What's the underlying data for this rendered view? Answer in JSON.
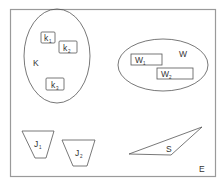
{
  "diagram": {
    "universe_label": "E",
    "sets": [
      {
        "id": "K",
        "label": "K",
        "shape": "ellipse",
        "members": [
          {
            "base": "k",
            "sub": "1"
          },
          {
            "base": "k",
            "sub": "2"
          },
          {
            "base": "k",
            "sub": "3"
          }
        ]
      },
      {
        "id": "W",
        "label": "W",
        "shape": "ellipse",
        "members": [
          {
            "base": "W",
            "sub": "1"
          },
          {
            "base": "W",
            "sub": "2"
          }
        ]
      }
    ],
    "trapezoids": [
      {
        "base": "J",
        "sub": "1"
      },
      {
        "base": "J",
        "sub": "2"
      }
    ],
    "triangle": {
      "label": "S"
    }
  },
  "colors": {
    "stroke": "#555555",
    "frame": "#9a9a9a",
    "text": "#333333"
  }
}
